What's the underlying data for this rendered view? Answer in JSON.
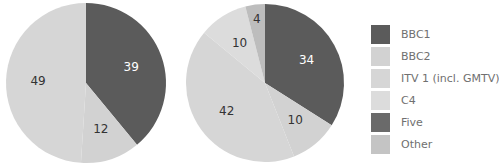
{
  "chart_data": [
    {
      "type": "pie",
      "title": "",
      "categories": [
        "BBC1",
        "BBC2",
        "ITV 1 (incl. GMTV)"
      ],
      "values": [
        39,
        12,
        49
      ],
      "colors": [
        "#5b5b5b",
        "#d2d2d2",
        "#d6d6d6"
      ],
      "label_colors": [
        "#ffffff",
        "#333333",
        "#333333"
      ],
      "center": [
        86,
        83
      ],
      "radius": 80
    },
    {
      "type": "pie",
      "title": "",
      "categories": [
        "BBC1",
        "BBC2",
        "ITV 1 (incl. GMTV)",
        "C4",
        "Other"
      ],
      "values": [
        34,
        10,
        42,
        10,
        4
      ],
      "colors": [
        "#5b5b5b",
        "#d2d2d2",
        "#d6d6d6",
        "#dcdcdc",
        "#bdbdbd"
      ],
      "label_colors": [
        "#ffffff",
        "#333333",
        "#333333",
        "#333333",
        "#333333"
      ],
      "center": [
        265,
        83
      ],
      "radius": 79
    }
  ],
  "legend": {
    "position": "right",
    "items": [
      {
        "label": "BBC1",
        "color": "#5b5b5b"
      },
      {
        "label": "BBC2",
        "color": "#d2d2d2"
      },
      {
        "label": "ITV 1 (incl. GMTV)",
        "color": "#d6d6d6"
      },
      {
        "label": "C4",
        "color": "#dcdcdc"
      },
      {
        "label": "Five",
        "color": "#6a6a6a"
      },
      {
        "label": "Other",
        "color": "#c4c4c4"
      }
    ]
  }
}
